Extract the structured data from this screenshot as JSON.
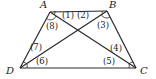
{
  "figure": {
    "type": "trapezoid-with-diagonals",
    "vertices": [
      {
        "id": "A",
        "label": "A",
        "x": 50,
        "y": 12,
        "lx": 40,
        "ly": 8
      },
      {
        "id": "B",
        "label": "B",
        "x": 107,
        "y": 11,
        "lx": 109,
        "ly": 8
      },
      {
        "id": "C",
        "label": "C",
        "x": 136,
        "y": 68,
        "lx": 140,
        "ly": 74
      },
      {
        "id": "D",
        "label": "D",
        "x": 20,
        "y": 68,
        "lx": 6,
        "ly": 74
      }
    ],
    "segments": [
      {
        "from": "A",
        "to": "B",
        "name": "side-ab"
      },
      {
        "from": "B",
        "to": "C",
        "name": "side-bc"
      },
      {
        "from": "C",
        "to": "D",
        "name": "side-cd"
      },
      {
        "from": "D",
        "to": "A",
        "name": "side-da"
      },
      {
        "from": "A",
        "to": "C",
        "name": "diagonal-ac"
      },
      {
        "from": "B",
        "to": "D",
        "name": "diagonal-bd"
      }
    ],
    "angle_labels": [
      {
        "label": "(1)",
        "x": 62,
        "y": 18
      },
      {
        "label": "(2)",
        "x": 78,
        "y": 18
      },
      {
        "label": "(3)",
        "x": 97,
        "y": 27
      },
      {
        "label": "(4)",
        "x": 110,
        "y": 51
      },
      {
        "label": "(5)",
        "x": 104,
        "y": 64
      },
      {
        "label": "(6)",
        "x": 36,
        "y": 64
      },
      {
        "label": "(7)",
        "x": 30,
        "y": 50
      },
      {
        "label": "(8)",
        "x": 46,
        "y": 29
      }
    ]
  }
}
